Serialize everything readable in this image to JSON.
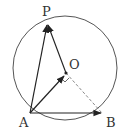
{
  "diagram": {
    "type": "geometry",
    "circle": {
      "center": "O",
      "cx": 65,
      "cy": 68,
      "r": 52
    },
    "points": {
      "P": {
        "label": "P",
        "x": 47,
        "y": 24,
        "lx": 42,
        "ly": 16
      },
      "O": {
        "label": "O",
        "x": 66,
        "y": 73,
        "lx": 69,
        "ly": 69
      },
      "A": {
        "label": "A",
        "x": 30,
        "y": 113,
        "lx": 19,
        "ly": 127
      },
      "B": {
        "label": "B",
        "x": 102,
        "y": 113,
        "lx": 106,
        "ly": 127
      }
    },
    "vectors": [
      "AP",
      "OP",
      "AO",
      "AB"
    ],
    "dashed_segments": [
      "OB"
    ],
    "right_angle_mark": "at O between AO and OB",
    "colors": {
      "stroke": "#333333",
      "dashed": "#888888",
      "circle": "#555555"
    }
  }
}
